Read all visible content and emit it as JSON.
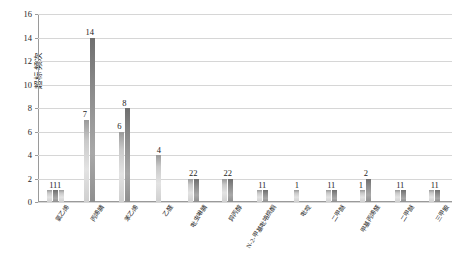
{
  "chart_data": {
    "type": "bar",
    "title": "",
    "subtitle": "",
    "xlabel": "",
    "ylabel": "超标频次",
    "ylim": [
      0,
      16
    ],
    "y_ticks": [
      0,
      2,
      4,
      6,
      8,
      10,
      12,
      14,
      16
    ],
    "grid": true,
    "legend": "none",
    "orientation": "vertical",
    "categories": [
      "氯乙烯",
      "丙烯腈",
      "苯乙烯",
      "乙醛",
      "吡虫啉腈",
      "异丙醇",
      "N-2-甲基吡咯烷酮",
      "吡啶",
      "二甲醚",
      "甲基丙烯醛",
      "二甲醚",
      "三甲胺"
    ],
    "group_labels": [
      "111",
      "14",
      "8",
      "4",
      "22",
      "22",
      "11",
      "1",
      "11",
      "2",
      "11",
      "11"
    ],
    "secondary_labels": [
      "",
      "7",
      "6",
      "",
      "",
      "",
      "",
      "",
      "",
      "1",
      "",
      ""
    ],
    "groups": [
      {
        "category": "氯乙烯",
        "values": [
          1,
          1,
          1
        ],
        "label": "111",
        "extra_label": ""
      },
      {
        "category": "丙烯腈",
        "values": [
          7,
          14
        ],
        "label": "14",
        "extra_label": "7"
      },
      {
        "category": "苯乙烯",
        "values": [
          6,
          8
        ],
        "label": "8",
        "extra_label": "6"
      },
      {
        "category": "乙醛",
        "values": [
          4
        ],
        "label": "4",
        "extra_label": ""
      },
      {
        "category": "吡虫啉腈",
        "values": [
          2,
          2
        ],
        "label": "22",
        "extra_label": ""
      },
      {
        "category": "异丙醇",
        "values": [
          2,
          2
        ],
        "label": "22",
        "extra_label": ""
      },
      {
        "category": "N-2-甲基吡咯烷酮",
        "values": [
          1,
          1
        ],
        "label": "11",
        "extra_label": ""
      },
      {
        "category": "吡啶",
        "values": [
          1
        ],
        "label": "1",
        "extra_label": ""
      },
      {
        "category": "二甲醚",
        "values": [
          1,
          1
        ],
        "label": "11",
        "extra_label": ""
      },
      {
        "category": "甲基丙烯醛",
        "values": [
          1,
          2
        ],
        "label": "2",
        "extra_label": "1"
      },
      {
        "category": "二甲醚",
        "values": [
          1,
          1
        ],
        "label": "11",
        "extra_label": ""
      },
      {
        "category": "三甲胺",
        "values": [
          1,
          1
        ],
        "label": "11",
        "extra_label": ""
      }
    ],
    "series": [
      {
        "name": "series-1",
        "values": [
          1,
          7,
          6,
          4,
          2,
          2,
          1,
          1,
          1,
          1,
          1,
          1
        ]
      },
      {
        "name": "series-2",
        "values": [
          1,
          14,
          8,
          0,
          2,
          2,
          1,
          0,
          1,
          2,
          1,
          1
        ]
      },
      {
        "name": "series-3",
        "values": [
          1,
          0,
          0,
          0,
          0,
          0,
          0,
          0,
          0,
          0,
          0,
          0
        ]
      }
    ],
    "colors": {
      "bar_light": "#d9d9d9",
      "bar_dark": "#8c8c8c",
      "gridline": "#d6d6d6",
      "axis": "#9a9a9a",
      "text": "#1c1c1c",
      "background": "#ffffff"
    }
  }
}
